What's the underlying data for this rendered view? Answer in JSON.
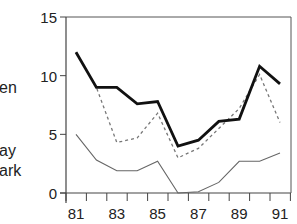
{
  "chart_data": {
    "type": "line",
    "title": "",
    "xlabel": "",
    "ylabel": "",
    "x": [
      81,
      82,
      83,
      84,
      85,
      86,
      87,
      88,
      89,
      90,
      91
    ],
    "x_tick_labels": [
      "81",
      "83",
      "85",
      "87",
      "89",
      "91"
    ],
    "y_tick_labels": [
      "0",
      "5",
      "10",
      "15"
    ],
    "ylim": [
      0,
      15
    ],
    "xlim": [
      80.5,
      91.5
    ],
    "grid": false,
    "legend": {
      "position": "left (clipped)",
      "entries": [
        "en",
        "ay",
        "ark"
      ]
    },
    "series": [
      {
        "name": "en",
        "style": "bold-solid",
        "color": "#111111",
        "values": [
          12.0,
          9.0,
          9.0,
          7.6,
          7.8,
          4.0,
          4.5,
          6.1,
          6.3,
          10.8,
          9.3
        ]
      },
      {
        "name": "ay",
        "style": "dotted",
        "color": "#777777",
        "values": [
          12.0,
          9.0,
          4.3,
          4.7,
          6.8,
          3.0,
          3.8,
          5.5,
          7.2,
          10.1,
          6.0
        ]
      },
      {
        "name": "ark",
        "style": "thin-solid",
        "color": "#666666",
        "values": [
          5.0,
          2.8,
          1.9,
          1.9,
          2.7,
          0.0,
          0.1,
          0.9,
          2.7,
          2.7,
          3.4
        ]
      }
    ]
  },
  "labels": {
    "side": [
      {
        "text": "en",
        "top": 80
      },
      {
        "text": "ay",
        "top": 143
      },
      {
        "text": "ark",
        "top": 163
      }
    ]
  }
}
